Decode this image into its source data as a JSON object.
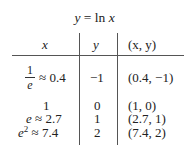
{
  "table": {
    "title": {
      "lhs": "y",
      "eq": " = ln ",
      "rhs": "x"
    },
    "headers": [
      "x",
      "y",
      "(x, y)"
    ],
    "rows": [
      {
        "x_num": "1",
        "x_den": "e",
        "x_approx": "≈ 0.4",
        "y": "−1",
        "point": "(0.4, −1)"
      },
      {
        "x": "1",
        "y": "0",
        "point": "(1, 0)"
      },
      {
        "x_base": "e",
        "x_approx": " ≈ 2.7",
        "y": "1",
        "point": "(2.7, 1)"
      },
      {
        "x_base": "e",
        "x_exp": "2",
        "x_approx": " ≈ 7.4",
        "y": "2",
        "point": "(7.4, 2)"
      }
    ]
  }
}
